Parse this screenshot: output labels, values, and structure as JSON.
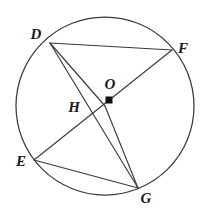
{
  "figure": {
    "shape_type": "circle-geometry-diagram",
    "background_color": "#ffffff",
    "stroke_color": "#3a3a3a",
    "label_color": "#1a1a1a",
    "center_marker_color": "#111111",
    "canvas": {
      "width": 206,
      "height": 211
    }
  },
  "circle": {
    "center_x": 105,
    "center_y": 106,
    "radius": 89,
    "center_label": "O",
    "center_label_x": 110,
    "center_label_y": 89,
    "center_marker_x": 109,
    "center_marker_y": 100,
    "center_marker_size": 7
  },
  "points": [
    {
      "id": "D",
      "label": "D",
      "x": 50,
      "y": 43,
      "label_x": 36,
      "label_y": 39,
      "on_circle": true
    },
    {
      "id": "F",
      "label": "F",
      "x": 172,
      "y": 50,
      "label_x": 183,
      "label_y": 53,
      "on_circle": true
    },
    {
      "id": "E",
      "label": "E",
      "x": 34,
      "y": 160,
      "label_x": 21,
      "label_y": 166,
      "on_circle": true
    },
    {
      "id": "G",
      "label": "G",
      "x": 138,
      "y": 188,
      "label_x": 146,
      "label_y": 203,
      "on_circle": true
    },
    {
      "id": "H",
      "label": "H",
      "x": 92,
      "y": 115,
      "label_x": 74,
      "label_y": 112,
      "on_circle": false
    }
  ],
  "segments": [
    {
      "id": "DF",
      "from": "D",
      "to": "F",
      "label": "chord D to F"
    },
    {
      "id": "DG",
      "from": "D",
      "to": "G",
      "label": "chord D to G"
    },
    {
      "id": "DO",
      "from": "D",
      "to": "O",
      "label": "radius D to O"
    },
    {
      "id": "EF",
      "from": "E",
      "to": "F",
      "label": "chord E to F through O"
    },
    {
      "id": "EG",
      "from": "E",
      "to": "G",
      "label": "chord E to G"
    },
    {
      "id": "OG",
      "from": "O",
      "to": "G",
      "label": "radius O to G"
    }
  ]
}
